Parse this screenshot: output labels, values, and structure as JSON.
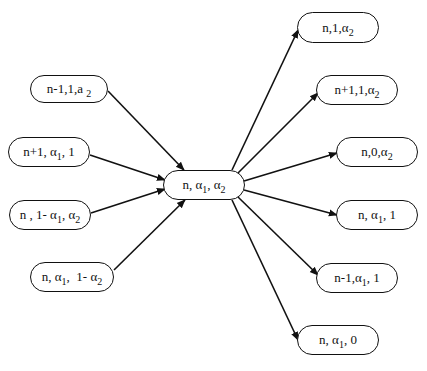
{
  "diagram": {
    "type": "state-transition-graph",
    "center": {
      "id": "c",
      "label_html": "n, &alpha;<sub>1</sub>, &alpha;<sub>2</sub>",
      "label_text": "n, α1, α2",
      "box": [
        163,
        170,
        82,
        30
      ]
    },
    "incoming": [
      {
        "id": "in1",
        "label_html": "n-1,1,a <sub>2</sub>",
        "label_text": "n-1,1,a2",
        "box": [
          30,
          75,
          78,
          28
        ]
      },
      {
        "id": "in2",
        "label_html": "n+1, &alpha;<sub>1</sub>, 1",
        "label_text": "n+1, α1, 1",
        "box": [
          8,
          137,
          82,
          30
        ]
      },
      {
        "id": "in3",
        "label_html": "n , 1- &alpha;<sub>1</sub>, &alpha;<sub>2</sub>",
        "label_text": "n , 1- α1, α2",
        "box": [
          9,
          200,
          82,
          30
        ]
      },
      {
        "id": "in4",
        "label_html": "n, &alpha;<sub>1</sub>, &nbsp;1- &alpha;<sub>2</sub>",
        "label_text": "n, α1, 1- α2",
        "box": [
          30,
          262,
          84,
          30
        ]
      }
    ],
    "outgoing": [
      {
        "id": "out1",
        "label_html": "n,1,&alpha;<sub>2</sub>",
        "label_text": "n,1,α2",
        "box": [
          297,
          12,
          82,
          31
        ]
      },
      {
        "id": "out2",
        "label_html": "n+1,1,&alpha;<sub>2</sub>",
        "label_text": "n+1,1,α2",
        "box": [
          316,
          75,
          82,
          30
        ]
      },
      {
        "id": "out3",
        "label_html": "n,0,&alpha;<sub>2</sub>",
        "label_text": "n,0,α2",
        "box": [
          336,
          137,
          82,
          30
        ]
      },
      {
        "id": "out4",
        "label_html": "n, &alpha;<sub>1</sub>, 1",
        "label_text": "n, α1, 1",
        "box": [
          336,
          200,
          82,
          30
        ]
      },
      {
        "id": "out5",
        "label_html": "n-1,&alpha;<sub>1</sub>, 1",
        "label_text": "n-1,α1, 1",
        "box": [
          316,
          263,
          82,
          30
        ]
      },
      {
        "id": "out6",
        "label_html": "n, &alpha;<sub>1</sub>, 0",
        "label_text": "n, α1, 0",
        "box": [
          297,
          325,
          82,
          30
        ]
      }
    ],
    "edges": [
      {
        "from": "in1",
        "to": "c",
        "path": [
          108,
          91,
          184,
          170
        ]
      },
      {
        "from": "in2",
        "to": "c",
        "path": [
          90,
          155,
          165,
          180
        ]
      },
      {
        "from": "in3",
        "to": "c",
        "path": [
          91,
          213,
          165,
          189
        ]
      },
      {
        "from": "in4",
        "to": "c",
        "path": [
          114,
          270,
          185,
          200
        ]
      },
      {
        "from": "c",
        "to": "out1",
        "path": [
          232,
          170,
          298,
          30
        ]
      },
      {
        "from": "c",
        "to": "out2",
        "path": [
          238,
          173,
          318,
          93
        ]
      },
      {
        "from": "c",
        "to": "out3",
        "path": [
          244,
          181,
          337,
          153
        ]
      },
      {
        "from": "c",
        "to": "out4",
        "path": [
          244,
          190,
          337,
          215
        ]
      },
      {
        "from": "c",
        "to": "out5",
        "path": [
          238,
          197,
          318,
          275
        ]
      },
      {
        "from": "c",
        "to": "out6",
        "path": [
          232,
          200,
          298,
          340
        ]
      }
    ],
    "colors": {
      "stroke": "#111111",
      "background": "#ffffff"
    }
  }
}
